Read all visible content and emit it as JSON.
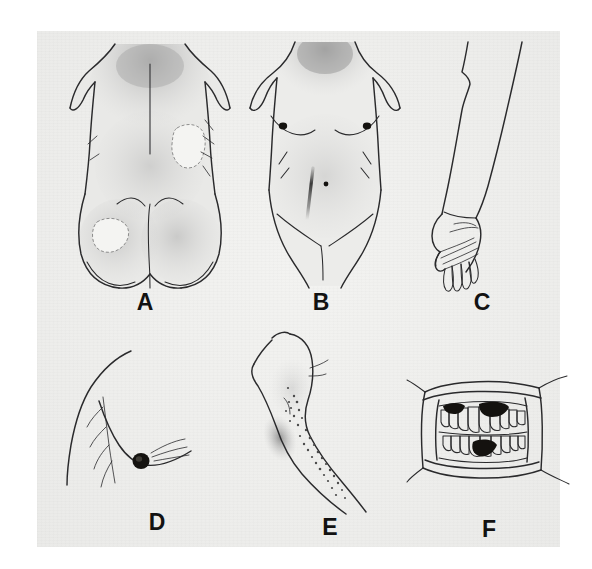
{
  "figure": {
    "background_color": "#ffffff",
    "plate_color": "#eeeeec",
    "ink_color": "#2a2a2c",
    "label_color": "#121212",
    "panel_count": 6,
    "layout": "2 rows x 3 columns"
  },
  "panels": [
    {
      "id": "A",
      "label": "A",
      "name": "posterior-torso",
      "description": "Posterior view of trunk and buttocks with diffuse hyperpigmented shading over the upper back and depigmented patches",
      "features": [
        "diffuse-upper-back-shading",
        "midline-spinal-groove",
        "depigmented-patch-right-flank",
        "depigmented-patch-left-buttock",
        "gluteal-cleft"
      ]
    },
    {
      "id": "B",
      "label": "B",
      "name": "anterior-torso",
      "description": "Anterior view of trunk with hyperpigmented shading across chest and neck, darkened nipples, linea nigra and umbilicus",
      "features": [
        "neck-and-upper-chest-shading",
        "dark-nipple-left",
        "dark-nipple-right",
        "linea-nigra",
        "umbilicus",
        "inguinal-creases"
      ]
    },
    {
      "id": "C",
      "label": "C",
      "name": "forearm-and-hand",
      "description": "Forearm with hand in relaxed position showing accentuated palmar creases",
      "features": [
        "forearm",
        "wrist",
        "palm-creases",
        "five-fingers",
        "thumb"
      ]
    },
    {
      "id": "D",
      "label": "D",
      "name": "breast-profile",
      "description": "Lateral profile of chest and breast with darkly pigmented areola and nipple",
      "features": [
        "chest-wall-contour",
        "breast-contour",
        "dark-areola",
        "radiating-lines"
      ]
    },
    {
      "id": "E",
      "label": "E",
      "name": "arm-with-pigmented-macules",
      "description": "Upper limb showing a cluster of small pigmented macules over the forearm and shading at the antecubital fossa",
      "features": [
        "arm-outline",
        "antecubital-shading",
        "scattered-pigmented-macules"
      ]
    },
    {
      "id": "F",
      "label": "F",
      "name": "oral-cavity",
      "description": "Retracted lips showing upper and lower teeth with dark pigmented patches on the gingiva",
      "features": [
        "lip-retractors",
        "upper-teeth",
        "lower-teeth",
        "pigmented-gingival-patch-upper-left",
        "pigmented-gingival-patch-upper-center",
        "pigmented-gingival-patch-lower-center"
      ]
    }
  ],
  "labels": {
    "a": "A",
    "b": "B",
    "c": "C",
    "d": "D",
    "e": "E",
    "f": "F"
  }
}
